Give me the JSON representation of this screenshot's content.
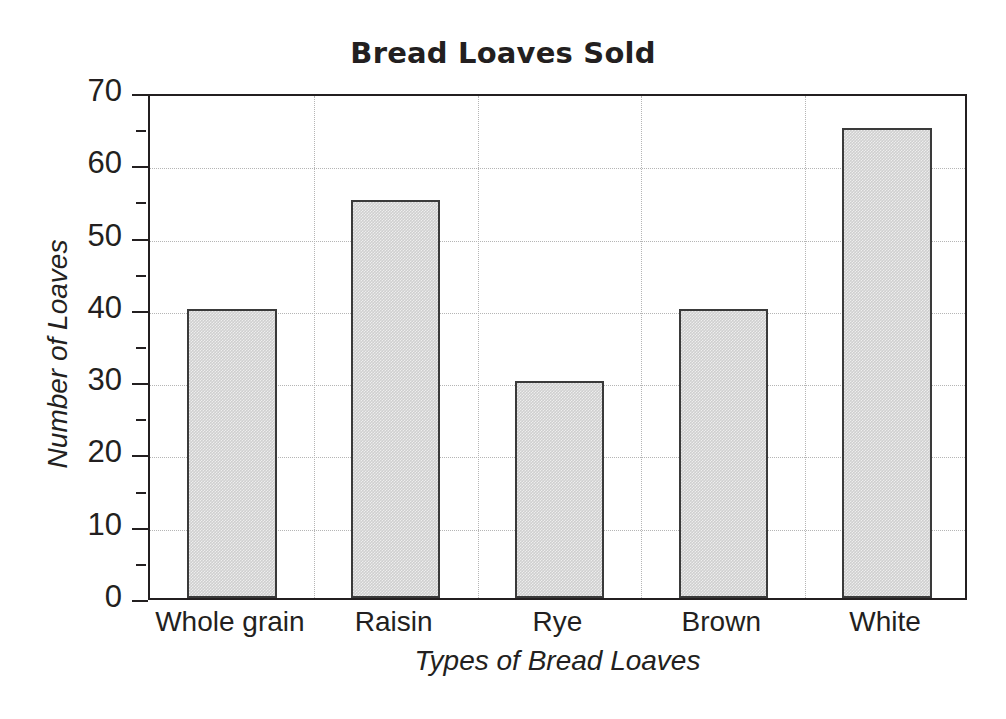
{
  "chart_data": {
    "type": "bar",
    "title": "Bread Loaves Sold",
    "xlabel": "Types of Bread Loaves",
    "ylabel": "Number of Loaves",
    "categories": [
      "Whole grain",
      "Raisin",
      "Rye",
      "Brown",
      "White"
    ],
    "values": [
      40,
      55,
      30,
      40,
      65
    ],
    "ylim": [
      0,
      70
    ],
    "ytick_labels": [
      "0",
      "10",
      "20",
      "30",
      "40",
      "50",
      "60",
      "70"
    ],
    "ytick_values": [
      0,
      10,
      20,
      30,
      40,
      50,
      60,
      70
    ],
    "yminor_values": [
      5,
      15,
      25,
      35,
      45,
      55,
      65
    ],
    "grid": "horizontal dotted at major ticks; vertical dotted at category boundaries",
    "legend": "none",
    "bar_fill_color": "#cfcfcf",
    "bar_edge_color": "#3a3a3a",
    "axis_color": "#231f20",
    "grid_color": "#b5b5b5",
    "background_color": "#ffffff"
  }
}
